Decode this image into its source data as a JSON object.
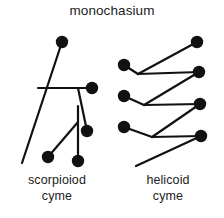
{
  "figure": {
    "title": "monochasium",
    "background_color": "#ffffff",
    "ink_color": "#111111",
    "line_width": 2.2,
    "node_radius": 6.2,
    "captions": {
      "left_line1": "scorpioiod",
      "left_line2": "cyme",
      "right_line1": "helicoid",
      "right_line2": "cyme"
    },
    "left_diagram": {
      "name": "scorpioiod-cyme-diagram",
      "nodes": [
        {
          "id": "L1",
          "cx": 62,
          "cy": 42
        },
        {
          "id": "L2",
          "cx": 92,
          "cy": 88
        },
        {
          "id": "L3",
          "cx": 87,
          "cy": 131
        },
        {
          "id": "L4",
          "cx": 78,
          "cy": 161
        },
        {
          "id": "L5",
          "cx": 48,
          "cy": 157
        }
      ],
      "edges": [
        {
          "id": "E1",
          "x1": 62,
          "y1": 42,
          "x2": 22,
          "y2": 163
        },
        {
          "id": "E2",
          "x1": 38,
          "y1": 88,
          "x2": 92,
          "y2": 88
        },
        {
          "id": "E3",
          "x1": 78,
          "y1": 88,
          "x2": 87,
          "y2": 131
        },
        {
          "id": "E4",
          "x1": 78,
          "y1": 106,
          "x2": 78,
          "y2": 161
        },
        {
          "id": "E5",
          "x1": 78,
          "y1": 122,
          "x2": 48,
          "y2": 157
        }
      ]
    },
    "right_diagram": {
      "name": "helicoid-cyme-diagram",
      "nodes": [
        {
          "id": "R1",
          "cx": 197,
          "cy": 42
        },
        {
          "id": "R2",
          "cx": 124,
          "cy": 65
        },
        {
          "id": "R3",
          "cx": 199,
          "cy": 72
        },
        {
          "id": "R4",
          "cx": 124,
          "cy": 96
        },
        {
          "id": "R5",
          "cx": 200,
          "cy": 104
        },
        {
          "id": "R6",
          "cx": 124,
          "cy": 127
        },
        {
          "id": "R7",
          "cx": 201,
          "cy": 136
        }
      ],
      "edges": [
        {
          "id": "F1",
          "x1": 197,
          "y1": 42,
          "x2": 138,
          "y2": 74
        },
        {
          "id": "F2",
          "x1": 124,
          "y1": 65,
          "x2": 138,
          "y2": 74
        },
        {
          "id": "F3",
          "x1": 138,
          "y1": 74,
          "x2": 199,
          "y2": 72
        },
        {
          "id": "F4",
          "x1": 199,
          "y1": 72,
          "x2": 144,
          "y2": 105
        },
        {
          "id": "F5",
          "x1": 124,
          "y1": 96,
          "x2": 144,
          "y2": 105
        },
        {
          "id": "F6",
          "x1": 144,
          "y1": 105,
          "x2": 200,
          "y2": 104
        },
        {
          "id": "F7",
          "x1": 200,
          "y1": 104,
          "x2": 152,
          "y2": 137
        },
        {
          "id": "F8",
          "x1": 124,
          "y1": 127,
          "x2": 152,
          "y2": 137
        },
        {
          "id": "F9",
          "x1": 152,
          "y1": 137,
          "x2": 201,
          "y2": 136
        },
        {
          "id": "F10",
          "x1": 201,
          "y1": 136,
          "x2": 136,
          "y2": 166
        }
      ]
    }
  }
}
